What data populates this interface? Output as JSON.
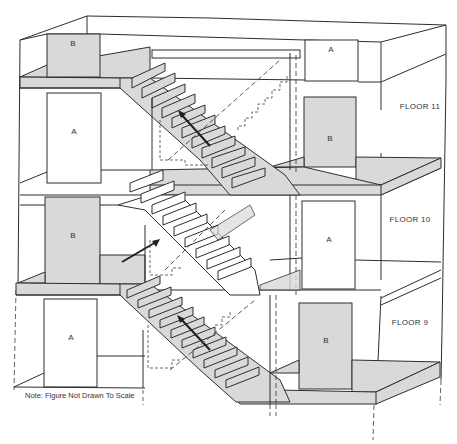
{
  "diagram": {
    "floors": [
      {
        "id": "floor-11",
        "label": "FLOOR 11"
      },
      {
        "id": "floor-10",
        "label": "FLOOR 10"
      },
      {
        "id": "floor-9",
        "label": "FLOOR 9"
      }
    ],
    "doors": {
      "top_left": "B",
      "top_right": "A",
      "f11_left": "A",
      "f11_right": "B",
      "f10_left": "B",
      "f10_right": "A",
      "f9_left": "A",
      "f9_right": "B"
    },
    "note": "Note: Figure Not Drawn To Scale",
    "colors": {
      "fill_gray": "#d9d9d9",
      "line": "#2e2e2e",
      "background": "#ffffff"
    }
  }
}
